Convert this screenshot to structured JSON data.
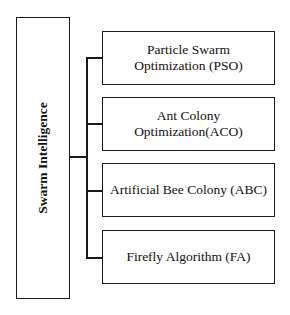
{
  "diagram": {
    "type": "tree",
    "root": {
      "label": "Swarm Intelligence"
    },
    "children": [
      {
        "label": "Particle Swarm Optimization (PSO)"
      },
      {
        "label": "Ant Colony Optimization(ACO)"
      },
      {
        "label": "Artificial Bee Colony (ABC)"
      },
      {
        "label": "Firefly Algorithm (FA)"
      }
    ]
  }
}
